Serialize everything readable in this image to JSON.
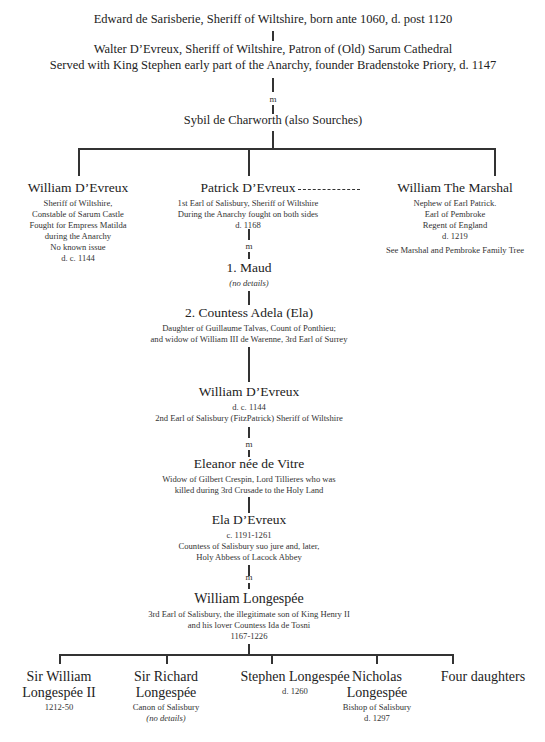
{
  "tree": {
    "gen1": {
      "edward": "Edward de Sarisberie, Sheriff of Wiltshire, born ante 1060, d. post 1120",
      "walter": {
        "line1": "Walter D’Evreux, Sheriff of Wiltshire, Patron of (Old) Sarum Cathedral",
        "line2": "Served with King Stephen early part of the Anarchy, founder Bradenstoke Priory, d. 1147"
      },
      "marriage_marker": "m",
      "sybil": "Sybil de Charworth (also Sourches)"
    },
    "gen2": {
      "william": {
        "name": "William D’Evreux",
        "details": [
          "Sheriff of Wiltshire,",
          "Constable of Sarum Castle",
          "Fought for Empress Matilda",
          "during the Anarchy",
          "No known issue",
          "d. c. 1144"
        ]
      },
      "patrick": {
        "name": "Patrick D’Evreux",
        "details": [
          "1st Earl of Salisbury, Sheriff of Wiltshire",
          "During the Anarchy fought on both sides",
          "d. 1168"
        ]
      },
      "marshal": {
        "name": "William The Marshal",
        "details": [
          "Nephew of Earl Patrick.",
          "Earl of Pembroke",
          "Regent of England",
          "d. 1219"
        ],
        "note": "See Marshal and Pembroke Family Tree"
      }
    },
    "patrick_spouses": {
      "marriage_marker": "m",
      "maud": {
        "name": "1. Maud",
        "note": "(no details)"
      },
      "adela": {
        "name": "2. Countess Adela (Ela)",
        "details": [
          "Daughter of Guillaume Talvas, Count of Ponthieu;",
          "and widow of William III de Warenne, 3rd Earl of Surrey"
        ]
      }
    },
    "gen3": {
      "william2": {
        "name": "William D’Evreux",
        "details": [
          "d. c. 1144",
          "2nd Earl of Salisbury (FitzPatrick) Sheriff of Wiltshire"
        ]
      },
      "marriage_marker": "m",
      "eleanor": {
        "name": "Eleanor née de Vitre",
        "details": [
          "Widow of Gilbert Crespin, Lord Tillieres who was",
          "killed during 3rd Crusade to the Holy Land"
        ]
      }
    },
    "gen4": {
      "ela": {
        "name": "Ela D’Evreux",
        "details": [
          "c. 1191-1261",
          "Countess of Salisbury suo jure and, later,",
          "Holy Abbess of Lacock Abbey"
        ]
      },
      "marriage_marker": "m",
      "longespee": {
        "name": "William Longespée",
        "details": [
          "3rd Earl of Salisbury, the illegitimate son of King Henry II",
          "and his lover Countess Ida de Tosni",
          "1167-1226"
        ]
      }
    },
    "gen5": {
      "children": [
        {
          "name_l1": "Sir William",
          "name_l2": "Longespée II",
          "details": [
            "1212-50"
          ]
        },
        {
          "name_l1": "Sir Richard",
          "name_l2": "Longespée",
          "details": [
            "Canon of Salisbury"
          ],
          "note": "(no details)"
        },
        {
          "name_l1": "Stephen Longespée",
          "details": [
            "d. 1260"
          ]
        },
        {
          "name_l1": "Nicholas",
          "name_l2": "Longespée",
          "details": [
            "Bishop of Salisbury",
            "d. 1297"
          ]
        },
        {
          "name_l1": "Four daughters"
        }
      ]
    }
  }
}
